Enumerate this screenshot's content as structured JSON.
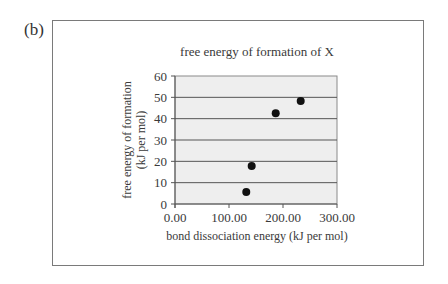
{
  "panel_label": "(b)",
  "chart_data": {
    "type": "scatter",
    "title": "free energy of formation of X",
    "xlabel": "bond dissociation energy (kJ per mol)",
    "ylabel_line1": "free energy of formation",
    "ylabel_line2": "(kJ per mol)",
    "xlim": [
      0,
      300
    ],
    "ylim": [
      0,
      60
    ],
    "x_ticks": [
      "0.00",
      "100.00",
      "200.00",
      "300.00"
    ],
    "y_ticks": [
      "0",
      "10",
      "20",
      "30",
      "40",
      "50",
      "60"
    ],
    "grid": "horizontal",
    "legend": null,
    "points": [
      {
        "x": 132,
        "y": 5.6
      },
      {
        "x": 142,
        "y": 17.8
      },
      {
        "x": 186.5,
        "y": 42.5
      },
      {
        "x": 232.8,
        "y": 48.3
      }
    ],
    "colors": {
      "plot_bg": "#eeeeee",
      "gridline": "#555555",
      "marker": "#111111",
      "frame": "#7a7a7a"
    }
  }
}
